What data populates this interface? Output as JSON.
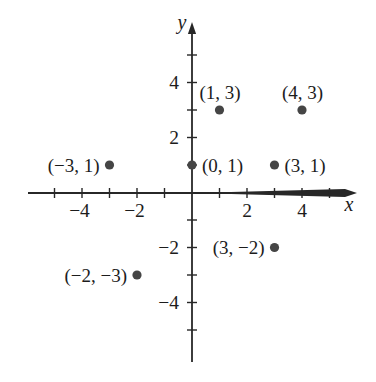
{
  "chart_data": {
    "type": "scatter",
    "title": "",
    "xlabel": "x",
    "ylabel": "y",
    "xlim": [
      -5.9,
      6.0
    ],
    "ylim": [
      -6.2,
      6.2
    ],
    "grid": false,
    "legend": false,
    "tick_step": 1,
    "points": [
      {
        "x": 1,
        "y": 3,
        "label": "(1, 3)",
        "label_side": "above"
      },
      {
        "x": 4,
        "y": 3,
        "label": "(4, 3)",
        "label_side": "above"
      },
      {
        "x": -3,
        "y": 1,
        "label": "(−3, 1)",
        "label_side": "left"
      },
      {
        "x": 0,
        "y": 1,
        "label": "(0, 1)",
        "label_side": "right"
      },
      {
        "x": 3,
        "y": 1,
        "label": "(3, 1)",
        "label_side": "right"
      },
      {
        "x": 3,
        "y": -2,
        "label": "(3, −2)",
        "label_side": "left"
      },
      {
        "x": -2,
        "y": -3,
        "label": "(−2, −3)",
        "label_side": "left"
      }
    ],
    "x_tick_labels": [
      {
        "value": -4,
        "label": "−4"
      },
      {
        "value": -2,
        "label": "−2"
      },
      {
        "value": 2,
        "label": "2"
      },
      {
        "value": 4,
        "label": "4"
      }
    ],
    "y_tick_labels": [
      {
        "value": 4,
        "label": "4"
      },
      {
        "value": 2,
        "label": "2"
      },
      {
        "value": -2,
        "label": "−2"
      },
      {
        "value": -4,
        "label": "−4"
      }
    ],
    "colors": {
      "axis": "#272727",
      "point": "#454545",
      "text": "#1c1c1c",
      "background": "#ffffff"
    },
    "point_radius_px": 4.6
  }
}
